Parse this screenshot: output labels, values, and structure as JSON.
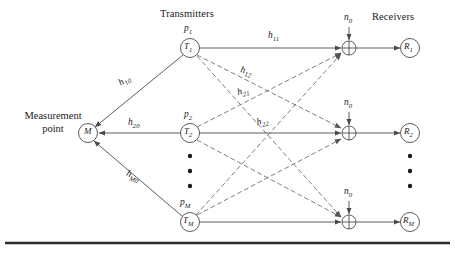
{
  "figure": {
    "title_transmitters": "Transmitters",
    "title_receivers": "Receivers",
    "measurement_line1": "Measurement",
    "measurement_line2": "point"
  },
  "nodes": {
    "measurement": {
      "label": "M"
    },
    "transmitters": [
      {
        "label": "T",
        "sub": "1",
        "power": "p",
        "power_sub": "1"
      },
      {
        "label": "T",
        "sub": "2",
        "power": "p",
        "power_sub": "2"
      },
      {
        "label": "T",
        "sub": "M",
        "power": "p",
        "power_sub": "M"
      }
    ],
    "receivers": [
      {
        "label": "R",
        "sub": "1"
      },
      {
        "label": "R",
        "sub": "2"
      },
      {
        "label": "R",
        "sub": "M"
      }
    ]
  },
  "noise": [
    {
      "label": "n",
      "sub": "0"
    },
    {
      "label": "n",
      "sub": "0"
    },
    {
      "label": "n",
      "sub": "0"
    }
  ],
  "channels": [
    {
      "label": "h",
      "sub": "11"
    },
    {
      "label": "h",
      "sub": "12"
    },
    {
      "label": "h",
      "sub": "21"
    },
    {
      "label": "h",
      "sub": "22"
    },
    {
      "label": "h",
      "sub": "10"
    },
    {
      "label": "h",
      "sub": "20"
    },
    {
      "label": "h",
      "sub": "M0"
    }
  ],
  "colors": {
    "stroke": "#4a4a4a",
    "text": "#1a1a1a",
    "rule": "#2b2b2b",
    "background": "#ffffff"
  }
}
